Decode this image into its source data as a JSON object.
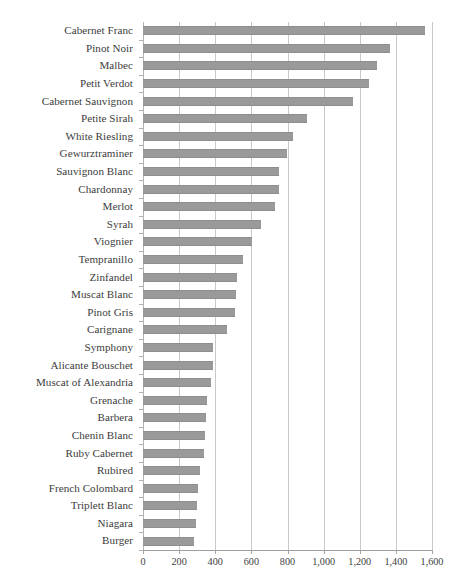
{
  "chart_data": {
    "type": "bar",
    "orientation": "horizontal",
    "title": "",
    "xlabel": "",
    "ylabel": "",
    "xlim": [
      0,
      1600
    ],
    "xticks": [
      0,
      200,
      400,
      600,
      800,
      1000,
      1200,
      1400,
      1600
    ],
    "xtick_labels": [
      "0",
      "200",
      "400",
      "600",
      "800",
      "1,000",
      "1,200",
      "1,400",
      "1,600"
    ],
    "grid": true,
    "grid_axis": "x",
    "legend": false,
    "bar_color": "#9a9a9a",
    "categories": [
      "Cabernet Franc",
      "Pinot Noir",
      "Malbec",
      "Petit Verdot",
      "Cabernet Sauvignon",
      "Petite Sirah",
      "White Riesling",
      "Gewurztraminer",
      "Sauvignon Blanc",
      "Chardonnay",
      "Merlot",
      "Syrah",
      "Viognier",
      "Tempranillo",
      "Zinfandel",
      "Muscat Blanc",
      "Pinot Gris",
      "Carignane",
      "Symphony",
      "Alicante Bouschet",
      "Muscat of Alexandria",
      "Grenache",
      "Barbera",
      "Chenin Blanc",
      "Ruby Cabernet",
      "Rubired",
      "French Colombard",
      "Triplett Blanc",
      "Niagara",
      "Burger"
    ],
    "values": [
      1560,
      1365,
      1295,
      1250,
      1165,
      910,
      830,
      795,
      755,
      755,
      730,
      655,
      605,
      555,
      520,
      515,
      510,
      465,
      390,
      385,
      375,
      355,
      350,
      345,
      335,
      315,
      305,
      300,
      295,
      285
    ]
  }
}
